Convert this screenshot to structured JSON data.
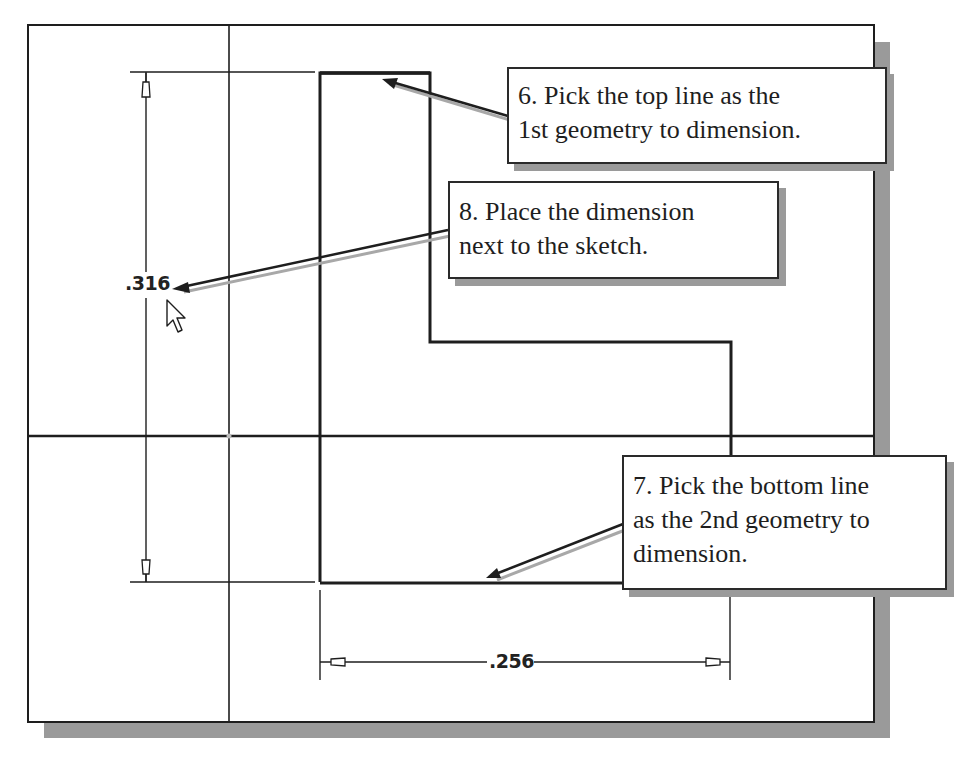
{
  "diagram": {
    "type": "cad-sketch-dimensioning-tutorial",
    "colors": {
      "line": "#1e1e1e",
      "shadow": "#9a9a9a",
      "background": "#ffffff",
      "leader_shadow": "#a8a8a8"
    },
    "dimensions": {
      "vertical": {
        "value": ".316"
      },
      "horizontal": {
        "value": ".256"
      }
    },
    "callouts": [
      {
        "step": 6,
        "lines": [
          "6. Pick the top line as the",
          "1st geometry to dimension."
        ]
      },
      {
        "step": 8,
        "lines": [
          "8. Place the dimension",
          "next to the sketch."
        ]
      },
      {
        "step": 7,
        "lines": [
          "7. Pick the bottom line",
          "as the 2nd geometry to",
          "dimension."
        ]
      }
    ],
    "cursor": {
      "icon": "arrow-pointer-icon"
    }
  }
}
